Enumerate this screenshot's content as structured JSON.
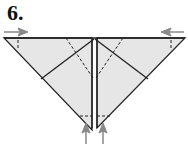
{
  "diagram": {
    "step_label": "6.",
    "type": "origami fold instruction",
    "colors": {
      "paper_fill": "#e6e6e6",
      "line": "#222222",
      "arrow": "#888888"
    },
    "elements": [
      {
        "name": "inverted-triangle-paper"
      },
      {
        "name": "center-slit"
      },
      {
        "name": "left-push-arrow",
        "direction": "right"
      },
      {
        "name": "right-push-arrow",
        "direction": "left"
      },
      {
        "name": "bottom-push-arrows",
        "direction": "up",
        "count": 2
      },
      {
        "name": "valley-fold-lines",
        "style": "dashed"
      }
    ]
  }
}
